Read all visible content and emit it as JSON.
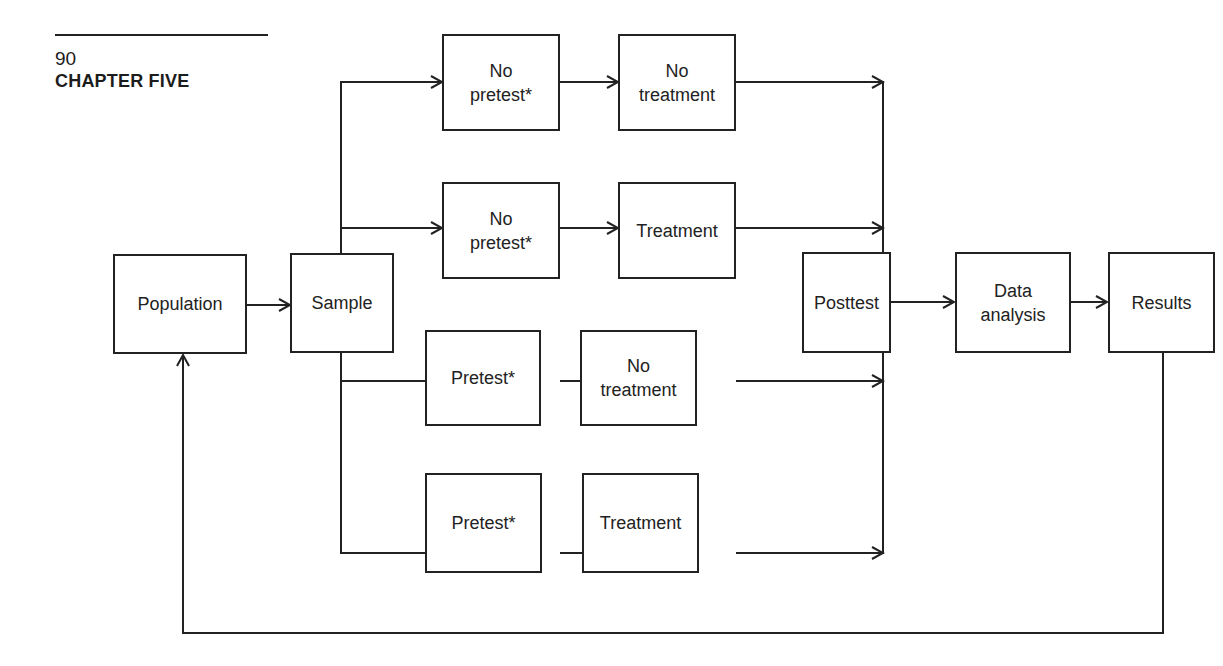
{
  "running_head": {
    "page_number": "90",
    "chapter": "CHAPTER FIVE"
  },
  "diagram": {
    "nodes": {
      "population": "Population",
      "sample": "Sample",
      "group1_pretest": "No\npretest*",
      "group1_treatment": "No\ntreatment",
      "group2_pretest": "No\npretest*",
      "group2_treatment": "Treatment",
      "group3_pretest": "Pretest*",
      "group3_treatment": "No\ntreatment",
      "group4_pretest": "Pretest*",
      "group4_treatment": "Treatment",
      "posttest": "Posttest",
      "data_analysis": "Data\nanalysis",
      "results": "Results"
    },
    "edges": [
      [
        "population",
        "sample"
      ],
      [
        "sample",
        "group1_pretest"
      ],
      [
        "sample",
        "group2_pretest"
      ],
      [
        "sample",
        "group3_pretest"
      ],
      [
        "sample",
        "group4_pretest"
      ],
      [
        "group1_pretest",
        "group1_treatment"
      ],
      [
        "group2_pretest",
        "group2_treatment"
      ],
      [
        "group3_pretest",
        "group3_treatment"
      ],
      [
        "group4_pretest",
        "group4_treatment"
      ],
      [
        "group1_treatment",
        "posttest"
      ],
      [
        "group2_treatment",
        "posttest"
      ],
      [
        "group3_treatment",
        "posttest"
      ],
      [
        "group4_treatment",
        "posttest"
      ],
      [
        "posttest",
        "data_analysis"
      ],
      [
        "data_analysis",
        "results"
      ],
      [
        "results",
        "population"
      ]
    ],
    "line_color": "#222222"
  }
}
